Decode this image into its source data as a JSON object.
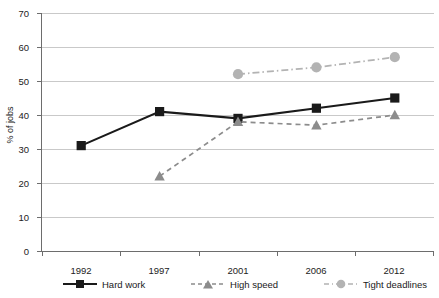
{
  "chart_data": {
    "type": "line",
    "title": "",
    "xlabel": "",
    "ylabel": "% of jobs",
    "categories": [
      "1992",
      "1997",
      "2001",
      "2006",
      "2012"
    ],
    "ylim": [
      0,
      70
    ],
    "ytick_step": 10,
    "yticks": [
      "0",
      "10",
      "20",
      "30",
      "40",
      "50",
      "60",
      "70"
    ],
    "grid": true,
    "legend_position": "bottom",
    "series": [
      {
        "name": "Hard work",
        "marker": "square",
        "line_style": "solid",
        "color": "#1a1a1a",
        "values": [
          31,
          41,
          39,
          42,
          45
        ]
      },
      {
        "name": "High speed",
        "marker": "triangle",
        "line_style": "dashed",
        "color": "#8c8c8c",
        "values": [
          null,
          22,
          38,
          37,
          40
        ]
      },
      {
        "name": "Tight deadlines",
        "marker": "circle",
        "line_style": "dashdot",
        "color": "#b3b3b3",
        "values": [
          null,
          null,
          52,
          54,
          57
        ]
      }
    ]
  },
  "axis": {
    "ylabel": "% of jobs",
    "ytick_0": "0",
    "ytick_10": "10",
    "ytick_20": "20",
    "ytick_30": "30",
    "ytick_40": "40",
    "ytick_50": "50",
    "ytick_60": "60",
    "ytick_70": "70",
    "xtick_1992": "1992",
    "xtick_1997": "1997",
    "xtick_2001": "2001",
    "xtick_2006": "2006",
    "xtick_2012": "2012"
  },
  "legend": {
    "hard_work": "Hard work",
    "high_speed": "High speed",
    "tight_deadlines": "Tight deadlines"
  },
  "colors": {
    "hard_work": "#1a1a1a",
    "high_speed": "#8c8c8c",
    "tight_deadlines": "#b3b3b3",
    "grid": "#c9c9c9",
    "axis": "#6d6d6d"
  }
}
